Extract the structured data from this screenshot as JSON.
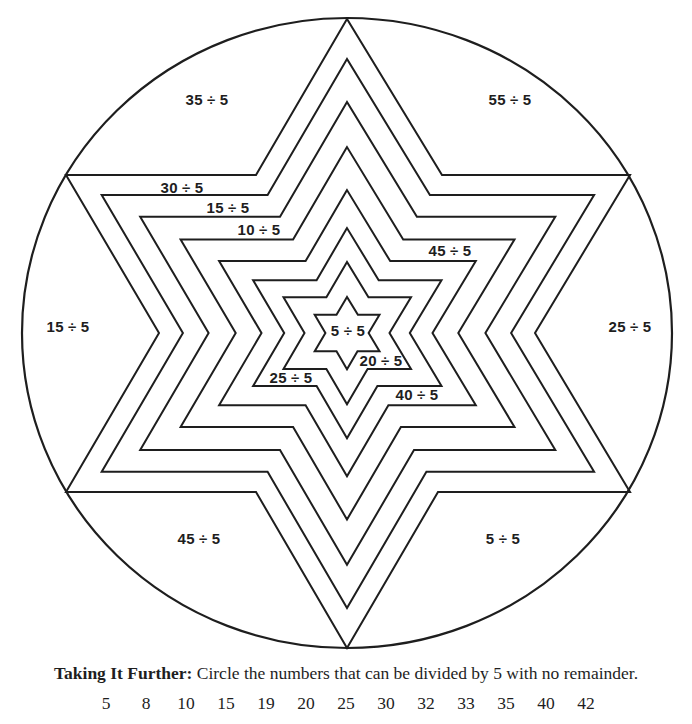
{
  "worksheet": {
    "center": [
      347,
      333
    ],
    "circle": {
      "rx": 325,
      "ry": 315,
      "stroke": "#1e1e1e"
    },
    "star_shape": [
      [
        0,
        -314
      ],
      [
        -91,
        -158
      ],
      [
        -281,
        -158
      ],
      [
        -188,
        0
      ],
      [
        -281,
        159
      ],
      [
        -91,
        159
      ],
      [
        0,
        315
      ],
      [
        91,
        159
      ],
      [
        283,
        159
      ],
      [
        188,
        0
      ],
      [
        283,
        -158
      ],
      [
        95,
        -158
      ]
    ],
    "star_scales": [
      1,
      0.873,
      0.736,
      0.592,
      0.455,
      0.334,
      0.226,
      0.115
    ],
    "line_color": "#1e1e1e",
    "regions": [
      {
        "id": "top-left",
        "text": "35 ÷ 5",
        "x": 207,
        "y": 99
      },
      {
        "id": "top-right",
        "text": "55 ÷ 5",
        "x": 510,
        "y": 99
      },
      {
        "id": "left",
        "text": "15 ÷ 5",
        "x": 68,
        "y": 326
      },
      {
        "id": "right",
        "text": "25 ÷ 5",
        "x": 630,
        "y": 326
      },
      {
        "id": "bottom-left",
        "text": "45 ÷ 5",
        "x": 199,
        "y": 538
      },
      {
        "id": "bottom-right",
        "text": "5 ÷ 5",
        "x": 503,
        "y": 538
      },
      {
        "id": "band-1",
        "text": "30 ÷ 5",
        "x": 182,
        "y": 187
      },
      {
        "id": "band-2",
        "text": "15 ÷ 5",
        "x": 228,
        "y": 207
      },
      {
        "id": "band-3",
        "text": "10 ÷ 5",
        "x": 259,
        "y": 229
      },
      {
        "id": "band-4",
        "text": "45 ÷ 5",
        "x": 450,
        "y": 250
      },
      {
        "id": "band-5",
        "text": "40 ÷ 5",
        "x": 417,
        "y": 394
      },
      {
        "id": "band-6",
        "text": "25 ÷ 5",
        "x": 291,
        "y": 377
      },
      {
        "id": "band-7",
        "text": "20 ÷ 5",
        "x": 381,
        "y": 360
      },
      {
        "id": "center",
        "text": "5 ÷ 5",
        "x": 348,
        "y": 330
      }
    ]
  },
  "footer": {
    "instruction_bold": "Taking It Further:",
    "instruction_text": " Circle the numbers that can be divided by 5 with no remainder.",
    "numbers": [
      "5",
      "8",
      "10",
      "15",
      "19",
      "20",
      "25",
      "30",
      "32",
      "33",
      "35",
      "40",
      "42"
    ]
  }
}
